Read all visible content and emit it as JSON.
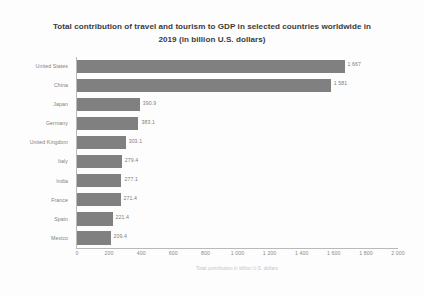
{
  "chart_data": {
    "type": "bar",
    "orientation": "horizontal",
    "title_line1": "Total contribution of travel and tourism to GDP in selected countries worldwide in",
    "title_line2": "2019 (in billion U.S. dollars)",
    "categories": [
      "United States",
      "China",
      "Japan",
      "Germany",
      "United Kingdom",
      "Italy",
      "India",
      "France",
      "Spain",
      "Mexico"
    ],
    "values": [
      1667,
      1581,
      390.9,
      383.1,
      303.1,
      279.4,
      277.1,
      271.4,
      221.4,
      209.4
    ],
    "value_labels": [
      "1 667",
      "1 581",
      "390.9",
      "383.1",
      "303.1",
      "279.4",
      "277.1",
      "271.4",
      "221.4",
      "209.4"
    ],
    "xlabel": "Total contribution in billion U.S. dollars",
    "ylabel": "",
    "xlim": [
      0,
      2000
    ],
    "xticks": [
      0,
      200,
      400,
      600,
      800,
      1000,
      1200,
      1400,
      1600,
      1800,
      2000
    ],
    "xtick_labels": [
      "0",
      "200",
      "400",
      "600",
      "800",
      "1 000",
      "1 200",
      "1 400",
      "1 600",
      "1 800",
      "2 000"
    ],
    "grid": false,
    "legend": false,
    "bar_color": "#808080",
    "axis_color": "#b9b9b9",
    "text_color": "#7d7d7d",
    "background": "#fdfdfd"
  }
}
